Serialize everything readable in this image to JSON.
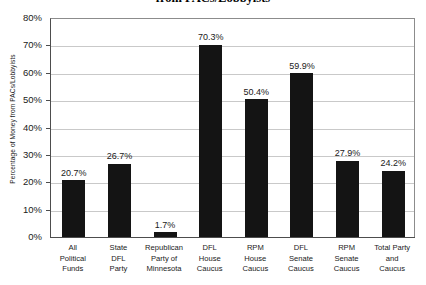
{
  "chart_data": {
    "type": "bar",
    "title": "from PACs/Lobbyists",
    "xlabel": "",
    "ylabel": "Percentage of Money from PACs/Lobbyists",
    "ylim": [
      0,
      80
    ],
    "ytick_labels": [
      "80%",
      "70%",
      "60%",
      "50%",
      "40%",
      "30%",
      "20%",
      "10%",
      "0%"
    ],
    "ytick_values": [
      80,
      70,
      60,
      50,
      40,
      30,
      20,
      10,
      0
    ],
    "grid": true,
    "legend": null,
    "bar_color": "#141414",
    "categories": [
      "All Political Funds",
      "State DFL Party",
      "Republican Party of Minnesota",
      "DFL House Caucus",
      "RPM House Caucus",
      "DFL Senate Caucus",
      "RPM Senate Caucus",
      "Total Party and Caucus"
    ],
    "category_label_lines": [
      [
        "All",
        "Political",
        "Funds"
      ],
      [
        "State",
        "DFL",
        "Party"
      ],
      [
        "Republican",
        "Party of",
        "Minnesota"
      ],
      [
        "DFL",
        "House",
        "Caucus"
      ],
      [
        "RPM",
        "House",
        "Caucus"
      ],
      [
        "DFL",
        "Senate",
        "Caucus"
      ],
      [
        "RPM",
        "Senate",
        "Caucus"
      ],
      [
        "Total Party",
        "and",
        "Caucus"
      ]
    ],
    "values": [
      20.7,
      26.7,
      1.7,
      70.3,
      50.4,
      59.9,
      27.9,
      24.2
    ],
    "data_labels": [
      "20.7%",
      "26.7%",
      "1.7%",
      "70.3%",
      "50.4%",
      "59.9%",
      "27.9%",
      "24.2%"
    ]
  }
}
